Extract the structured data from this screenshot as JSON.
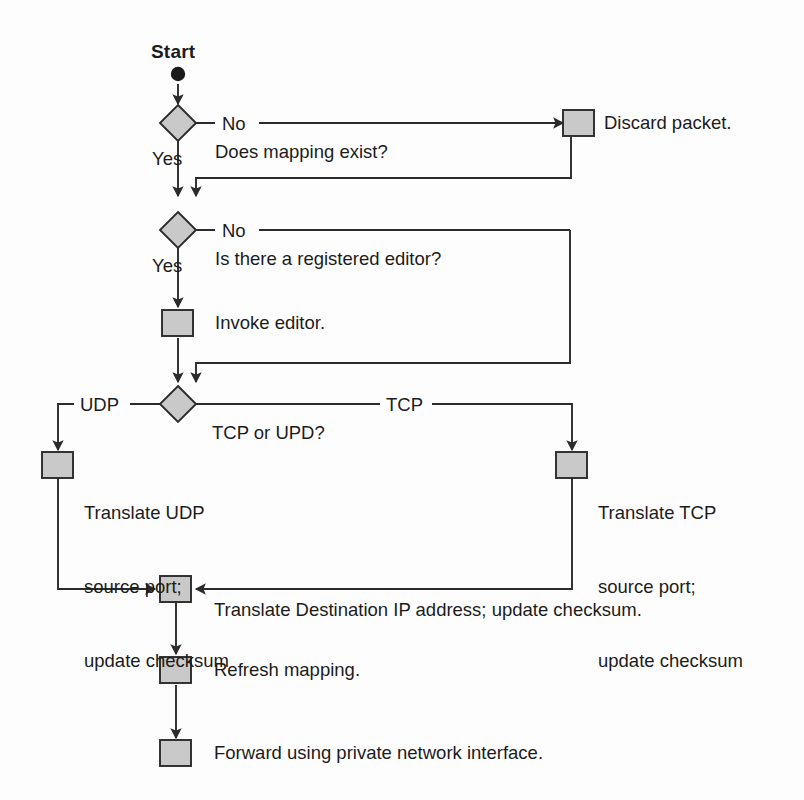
{
  "diagram": {
    "colors": {
      "node_fill": "#c9c9c9",
      "node_stroke": "#2b2b2b",
      "line": "#2b2b2b",
      "background": "#fdfdfd",
      "text": "#1c1c1c"
    },
    "start": {
      "label": "Start",
      "marker": "filled-circle"
    },
    "decisions": [
      {
        "id": "mapping-exists",
        "question": "Does mapping exist?",
        "yes_label": "Yes",
        "no_label": "No"
      },
      {
        "id": "registered-editor",
        "question": "Is there a registered editor?",
        "yes_label": "Yes",
        "no_label": "No"
      },
      {
        "id": "protocol",
        "question": "TCP or UPD?",
        "left_label": "UDP",
        "right_label": "TCP"
      }
    ],
    "processes": [
      {
        "id": "discard-packet",
        "label": "Discard packet."
      },
      {
        "id": "invoke-editor",
        "label": "Invoke editor."
      },
      {
        "id": "translate-udp",
        "lines": [
          "Translate UDP",
          "source port;",
          "update checksum"
        ]
      },
      {
        "id": "translate-tcp",
        "lines": [
          "Translate TCP",
          "source port;",
          "update checksum"
        ]
      },
      {
        "id": "translate-destination",
        "label": "Translate Destination IP address; update checksum."
      },
      {
        "id": "refresh-mapping",
        "label": "Refresh mapping."
      },
      {
        "id": "forward-packet",
        "label": "Forward using private network interface."
      }
    ]
  }
}
